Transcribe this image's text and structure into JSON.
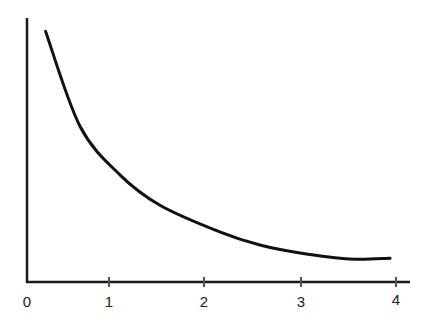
{
  "chart_data": {
    "type": "line",
    "title": "",
    "xlabel": "",
    "ylabel": "",
    "x_ticks": [
      0,
      1,
      2,
      3,
      4
    ],
    "x_tick_labels": [
      "0",
      "1",
      "2",
      "3",
      "4"
    ],
    "y_ticks": [],
    "xlim": [
      0,
      4.1
    ],
    "ylim": [
      0,
      10
    ],
    "grid": false,
    "legend": null,
    "series": [
      {
        "name": "decreasing curve",
        "color": "#111111",
        "x": [
          0.34,
          0.7,
          1.12,
          1.54,
          2.16,
          2.58,
          3.0,
          3.52,
          3.94
        ],
        "y": [
          9.5,
          5.9,
          4.05,
          2.9,
          1.9,
          1.4,
          1.1,
          0.87,
          0.9
        ]
      }
    ],
    "annotations": []
  },
  "axes": {
    "color": "#1a1a1a",
    "tick_labels": [
      "0",
      "1",
      "2",
      "3",
      "4"
    ]
  }
}
